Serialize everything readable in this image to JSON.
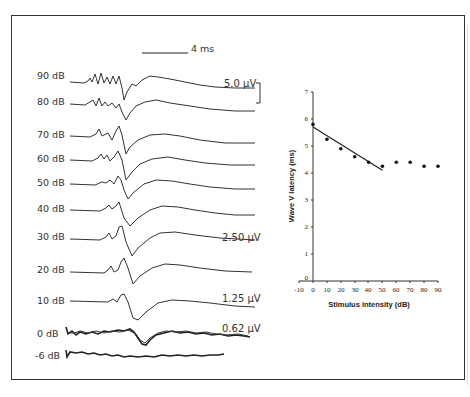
{
  "figure": {
    "time_scale_label": "4 ms",
    "amplitude_labels": [
      {
        "text": "5.0 µV",
        "row": "90 dB"
      },
      {
        "text": "2.50 µV",
        "row": "30 dB"
      },
      {
        "text": "1.25 µV",
        "row": "10 dB"
      },
      {
        "text": "0.62 µV",
        "row": "0 dB"
      }
    ],
    "trace_labels": [
      "90 dB",
      "80 dB",
      "70 dB",
      "60 dB",
      "50 dB",
      "40 dB",
      "30 dB",
      "20 dB",
      "10 dB",
      "0 dB",
      "-6 dB"
    ]
  },
  "chart_data": [
    {
      "type": "line",
      "title": "ABR waveforms by stimulus intensity",
      "series_labels": [
        "90 dB",
        "80 dB",
        "70 dB",
        "60 dB",
        "50 dB",
        "40 dB",
        "30 dB",
        "20 dB",
        "10 dB",
        "0 dB",
        "-6 dB"
      ],
      "scale_bars": {
        "time": "4 ms",
        "amplitude": "5.0 µV"
      },
      "amplitude_annotations": [
        "5.0 µV",
        "2.50 µV",
        "1.25 µV",
        "0.62 µV"
      ]
    },
    {
      "type": "scatter",
      "title": "",
      "xlabel": "Stimulus intensity (dB)",
      "ylabel": "Wave V latency (ms)",
      "x": [
        0,
        10,
        20,
        30,
        40,
        50,
        60,
        70,
        80,
        90
      ],
      "values": [
        5.8,
        5.25,
        4.9,
        4.6,
        4.4,
        4.25,
        4.4,
        4.4,
        4.25,
        4.25
      ],
      "xlim": [
        -10,
        90
      ],
      "ylim": [
        0,
        7
      ],
      "xticks": [
        "-10",
        "0",
        "10",
        "20",
        "30",
        "40",
        "50",
        "60",
        "70",
        "80",
        "90"
      ],
      "yticks": [
        "0",
        "1",
        "2",
        "3",
        "4",
        "5",
        "6",
        "7"
      ],
      "fit_line": {
        "x": [
          0,
          50
        ],
        "y": [
          5.7,
          4.1
        ]
      },
      "grid": false,
      "legend": "none"
    }
  ]
}
